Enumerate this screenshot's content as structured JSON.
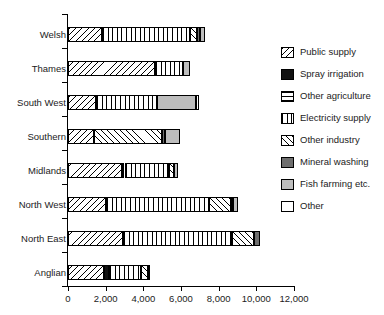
{
  "chart_data": {
    "type": "bar",
    "orientation": "horizontal",
    "stacked": true,
    "title": "",
    "xlabel": "",
    "ylabel": "",
    "xlim": [
      0,
      12000
    ],
    "xticks": [
      "0",
      "2,000",
      "4,000",
      "6,000",
      "8,000",
      "10,000",
      "12,000"
    ],
    "xtick_values": [
      0,
      2000,
      4000,
      6000,
      8000,
      10000,
      12000
    ],
    "grid": false,
    "legend_position": "right",
    "categories": [
      "Welsh",
      "Thames",
      "South West",
      "Southern",
      "Midlands",
      "North West",
      "North East",
      "Anglian"
    ],
    "series": [
      {
        "name": "Public supply",
        "key": "public",
        "pattern": "diagonal-hatch-down",
        "values": [
          1800,
          4600,
          1500,
          1400,
          2850,
          2000,
          2900,
          1900
        ]
      },
      {
        "name": "Spray irrigation",
        "key": "spray",
        "pattern": "solid-black",
        "values": [
          0,
          0,
          0,
          0,
          150,
          0,
          0,
          280
        ]
      },
      {
        "name": "Other agriculture",
        "key": "otheragri",
        "pattern": "horizontal-lines",
        "values": [
          0,
          0,
          0,
          0,
          0,
          0,
          0,
          0
        ]
      },
      {
        "name": "Electricity supply",
        "key": "elec",
        "pattern": "dotted-grid",
        "values": [
          4700,
          1500,
          3200,
          0,
          2350,
          5500,
          5800,
          1700
        ]
      },
      {
        "name": "Other industry",
        "key": "otherind",
        "pattern": "diagonal-hatch-up",
        "values": [
          350,
          0,
          0,
          3600,
          300,
          1150,
          1200,
          350
        ]
      },
      {
        "name": "Mineral washing",
        "key": "mineral",
        "pattern": "solid-dark-grey",
        "values": [
          150,
          0,
          0,
          150,
          0,
          120,
          300,
          0
        ]
      },
      {
        "name": "Fish farming etc.",
        "key": "fish",
        "pattern": "solid-light-grey",
        "values": [
          250,
          400,
          2100,
          800,
          200,
          250,
          0,
          150
        ]
      },
      {
        "name": "Other",
        "key": "other",
        "pattern": "white",
        "values": [
          0,
          0,
          150,
          0,
          0,
          0,
          0,
          0
        ]
      }
    ],
    "totals": [
      7250,
      6500,
      6950,
      5950,
      5850,
      9020,
      10200,
      4380
    ]
  },
  "legend": {
    "items": [
      {
        "label": "Public supply",
        "key": "public"
      },
      {
        "label": "Spray irrigation",
        "key": "spray"
      },
      {
        "label": "Other agriculture",
        "key": "otheragri"
      },
      {
        "label": "Electricity supply",
        "key": "elec"
      },
      {
        "label": "Other industry",
        "key": "otherind"
      },
      {
        "label": "Mineral washing",
        "key": "mineral"
      },
      {
        "label": "Fish farming etc.",
        "key": "fish"
      },
      {
        "label": "Other",
        "key": "other"
      }
    ]
  },
  "colors": {
    "axis": "#000000",
    "text": "#1b1b1b",
    "spray_irrigation": "#111111",
    "mineral_washing": "#6e6e6e",
    "fish_farming": "#bdbdbd",
    "background": "#ffffff"
  }
}
